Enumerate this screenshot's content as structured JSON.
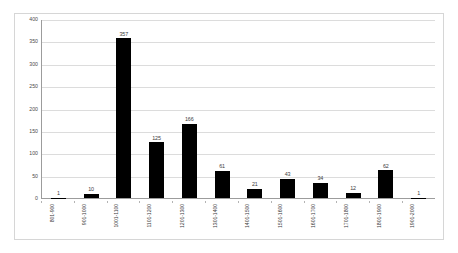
{
  "chart_data": {
    "type": "bar",
    "title": "",
    "subtitle": "",
    "xlabel": "",
    "ylabel": "",
    "ylim": [
      0,
      400
    ],
    "ytick_step": 50,
    "yticks": [
      "400",
      "350",
      "300",
      "250",
      "200",
      "150",
      "100",
      "50",
      "0"
    ],
    "grid": true,
    "legend": "none",
    "bar_color": "#000000",
    "gridline_color": "#dcdcdc",
    "axis_color": "#9c9c9c",
    "border_color": "#d6d6d6",
    "label_color": "#3c3c3c",
    "categories": [
      "801-900",
      "901-1000",
      "1001-1100",
      "1101-1200",
      "1201-1300",
      "1301-1400",
      "1401-1500",
      "1501-1600",
      "1601-1700",
      "1701-1800",
      "1801-1900",
      "1901-2000"
    ],
    "values": [
      1,
      10,
      357,
      125,
      166,
      61,
      21,
      43,
      34,
      12,
      62,
      1
    ],
    "data_labels": [
      "1",
      "10",
      "357",
      "125",
      "166",
      "61",
      "21",
      "43",
      "34",
      "12",
      "62",
      "1"
    ]
  }
}
